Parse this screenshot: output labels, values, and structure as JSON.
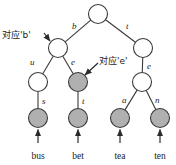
{
  "figure": {
    "type": "tree-diagram",
    "width": 176,
    "height": 165,
    "background": "#ffffff"
  },
  "colors": {
    "node_fill_white": "#ffffff",
    "node_fill_gray": "#b0b0b0",
    "stroke": "#3a3a3a",
    "text": "#1a1a1a"
  },
  "nodes": [
    {
      "id": "root",
      "x": 98,
      "y": 14,
      "r": 9.5,
      "fill": "white",
      "name": "node-root"
    },
    {
      "id": "b",
      "x": 58,
      "y": 48,
      "r": 9.5,
      "fill": "white",
      "name": "node-b"
    },
    {
      "id": "t",
      "x": 143,
      "y": 48,
      "r": 9.5,
      "fill": "white",
      "name": "node-t"
    },
    {
      "id": "bu",
      "x": 38,
      "y": 82,
      "r": 9.5,
      "fill": "white",
      "name": "node-bu"
    },
    {
      "id": "be",
      "x": 78,
      "y": 82,
      "r": 9.5,
      "fill": "gray",
      "name": "node-be"
    },
    {
      "id": "te",
      "x": 142,
      "y": 82,
      "r": 9.5,
      "fill": "white",
      "name": "node-te"
    },
    {
      "id": "bus",
      "x": 38,
      "y": 118,
      "r": 9.5,
      "fill": "gray",
      "name": "node-bus"
    },
    {
      "id": "bet",
      "x": 78,
      "y": 118,
      "r": 9.5,
      "fill": "gray",
      "name": "node-bet"
    },
    {
      "id": "tea",
      "x": 120,
      "y": 118,
      "r": 9.5,
      "fill": "gray",
      "name": "node-tea"
    },
    {
      "id": "ten",
      "x": 160,
      "y": 118,
      "r": 9.5,
      "fill": "gray",
      "name": "node-ten"
    }
  ],
  "edges": [
    {
      "from": "root",
      "to": "b",
      "label": "b",
      "lx": 72,
      "ly": 22,
      "name": "edge-root-b"
    },
    {
      "from": "root",
      "to": "t",
      "label": "t",
      "lx": 126,
      "ly": 22,
      "name": "edge-root-t"
    },
    {
      "from": "b",
      "to": "bu",
      "label": "u",
      "lx": 30,
      "ly": 58,
      "name": "edge-b-u"
    },
    {
      "from": "b",
      "to": "be",
      "label": "e",
      "lx": 71,
      "ly": 58,
      "name": "edge-b-e"
    },
    {
      "from": "t",
      "to": "te",
      "label": "e",
      "lx": 147,
      "ly": 62,
      "name": "edge-t-e"
    },
    {
      "from": "bu",
      "to": "bus",
      "label": "s",
      "lx": 42,
      "ly": 97,
      "name": "edge-u-s"
    },
    {
      "from": "be",
      "to": "bet",
      "label": "t",
      "lx": 82,
      "ly": 97,
      "name": "edge-e-t"
    },
    {
      "from": "te",
      "to": "tea",
      "label": "a",
      "lx": 122,
      "ly": 96,
      "name": "edge-e-a"
    },
    {
      "from": "te",
      "to": "ten",
      "label": "n",
      "lx": 155,
      "ly": 96,
      "name": "edge-e-n"
    }
  ],
  "leaf_labels": [
    {
      "text": "bus",
      "x": 38,
      "y": 152,
      "arrow_node": "bus",
      "name": "leaf-label-bus"
    },
    {
      "text": "bet",
      "x": 78,
      "y": 152,
      "arrow_node": "bet",
      "name": "leaf-label-bet"
    },
    {
      "text": "tea",
      "x": 120,
      "y": 152,
      "arrow_node": "tea",
      "name": "leaf-label-tea"
    },
    {
      "text": "ten",
      "x": 160,
      "y": 152,
      "arrow_node": "ten",
      "name": "leaf-label-ten"
    }
  ],
  "annotations": [
    {
      "id": "ann-b",
      "text": "对应'b'",
      "tx": 2,
      "ty": 31,
      "arrow": {
        "x1": 44,
        "y1": 33,
        "x2": 50,
        "y2": 41
      },
      "target": "b",
      "name": "annotation-corresponds-b"
    },
    {
      "id": "ann-e",
      "text": "对应'e'",
      "tx": 99,
      "ty": 57,
      "arrow": {
        "x1": 98,
        "y1": 63,
        "x2": 85,
        "y2": 75
      },
      "target": "be",
      "name": "annotation-corresponds-e"
    }
  ]
}
